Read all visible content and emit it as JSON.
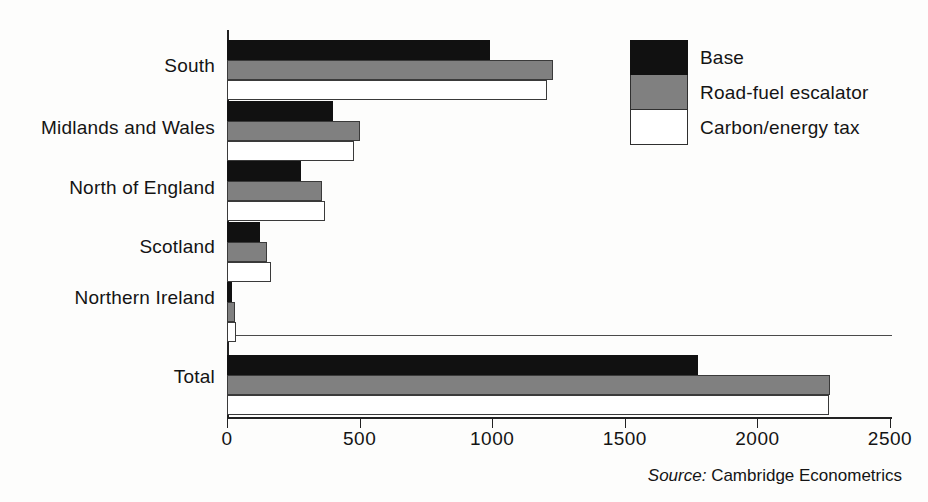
{
  "chart_data": {
    "type": "bar",
    "orientation": "horizontal",
    "title": "",
    "subtitle": "",
    "xlabel": "",
    "ylabel": "",
    "xlim": [
      0,
      2500
    ],
    "xticks": [
      0,
      500,
      1000,
      1500,
      2000,
      2500
    ],
    "xtick_labels": [
      "0",
      "500",
      "1000",
      "1500",
      "2000",
      "2500"
    ],
    "grid": false,
    "legend_position": "top-right",
    "categories": [
      "South",
      "Midlands and Wales",
      "North of England",
      "Scotland",
      "Northern Ireland",
      "Total"
    ],
    "series": [
      {
        "name": "Base",
        "color": "#111111",
        "values": [
          990,
          400,
          280,
          125,
          20,
          1775
        ]
      },
      {
        "name": "Road-fuel escalator",
        "color": "#808080",
        "values": [
          1230,
          500,
          360,
          150,
          30,
          2275
        ]
      },
      {
        "name": "Carbon/energy tax",
        "color": "#ffffff",
        "values": [
          1205,
          480,
          370,
          165,
          35,
          2270
        ]
      }
    ],
    "annotations": {
      "source": "Cambridge Econometrics",
      "source_prefix": "Source:",
      "separator_above_total": true
    }
  },
  "legend": {
    "items": [
      {
        "label": "Base",
        "swatch": "black-swatch"
      },
      {
        "label": "Road-fuel escalator",
        "swatch": "gray-swatch"
      },
      {
        "label": "Carbon/energy tax",
        "swatch": "white-swatch"
      }
    ]
  },
  "footer": {
    "source_prefix": "Source:",
    "source_text": "Cambridge Econometrics"
  }
}
